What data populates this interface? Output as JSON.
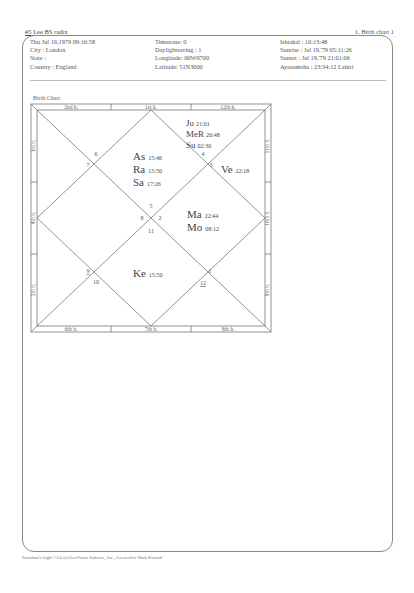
{
  "page": {
    "title_left": "#5 Lee BS radix",
    "title_right": "1. Birth chart 1"
  },
  "info": {
    "col1": [
      "Thu Jul 19,1979  09:16:58",
      "City :      London",
      "State :",
      "Country : England"
    ],
    "col2": [
      "Timezone: 0",
      "Daylightsaving : 1",
      "Longitude: 00W0700",
      "Latitude: 51N3000"
    ],
    "col3": [
      "Ishtakal : 10:13:48",
      "Sunrise : Jul 19,'79  05:11:26",
      "Sunset : Jul 19,'79  21:01:06",
      "Ayanamsha :   23:34:12 Lahiri"
    ]
  },
  "chart": {
    "caption": "Birth Chart",
    "frame_labels": {
      "top": [
        "2nd h.",
        "1st h.",
        "12th h."
      ],
      "bottom": [
        "6th h.",
        "7th h.",
        "8th h."
      ],
      "left": [
        "3rd h.",
        "4th h.",
        "5th h."
      ],
      "right": [
        "11th h.",
        "10th h.",
        "9th h."
      ]
    },
    "houses": [
      {
        "sign": "6"
      },
      {
        "sign": "7"
      },
      {
        "sign": "4"
      },
      {
        "sign": "3"
      },
      {
        "sign": "5"
      },
      {
        "sign": "8"
      },
      {
        "sign": "2"
      },
      {
        "sign": "11"
      },
      {
        "sign": "9"
      },
      {
        "sign": "10"
      },
      {
        "sign": "1"
      },
      {
        "sign": "12"
      }
    ],
    "planets": {
      "top_right": [
        {
          "name": "Ju",
          "deg": "21:01"
        },
        {
          "name": "MeR",
          "deg": "20:48"
        },
        {
          "name": "Su",
          "deg": "02:30"
        }
      ],
      "top_center": [
        {
          "name": "As",
          "deg": "15:46"
        },
        {
          "name": "Ra",
          "deg": "15:50"
        },
        {
          "name": "Sa",
          "deg": "17:26"
        }
      ],
      "right_top": [
        {
          "name": "Ve",
          "deg": "22:18"
        }
      ],
      "right_center": [
        {
          "name": "Ma",
          "deg": "22:44"
        },
        {
          "name": "Mo",
          "deg": "08:12"
        }
      ],
      "bottom_center": [
        {
          "name": "Ke",
          "deg": "15:50"
        }
      ]
    }
  },
  "footer": {
    "text": "Parashara's Light 7.0.4 (c) GeoVision Software, Inc., Licensed to Mark Kincaid"
  }
}
